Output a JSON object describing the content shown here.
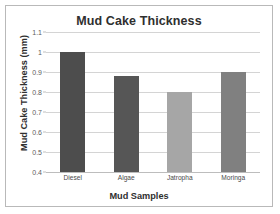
{
  "chart_data": {
    "type": "bar",
    "title": "Mud Cake Thickness",
    "xlabel": "Mud Samples",
    "ylabel": "Mud Cake Thickness (mm)",
    "categories": [
      "Diesel",
      "Algae",
      "Jatropha",
      "Moringa"
    ],
    "values": [
      1.0,
      0.88,
      0.8,
      0.9
    ],
    "bar_colors": [
      "#4d4d4d",
      "#565656",
      "#a6a6a6",
      "#808080"
    ],
    "ylim": [
      0.4,
      1.1
    ],
    "yticks": [
      1.1,
      1,
      0.9,
      0.8,
      0.7,
      0.6,
      0.5,
      0.4
    ],
    "ytick_labels": [
      "1.1",
      "1",
      "0.9",
      "0.8",
      "0.7",
      "0.6",
      "0.5",
      "0.4"
    ],
    "grid": "horizontal",
    "legend": "none",
    "background_color": "#ffffff",
    "border_color": "#b9b9b9",
    "gridline_color": "#d4d4d4",
    "text_color": "#2f2f2f"
  }
}
